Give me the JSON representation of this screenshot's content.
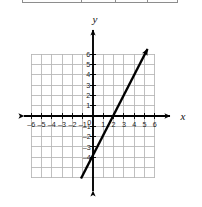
{
  "figure": {
    "background_color": "#ffffff",
    "width": 202,
    "height": 207
  },
  "table_crop": {
    "present": true,
    "border_color": "#8d8d8d",
    "divider_offsets": [
      58,
      92,
      124
    ]
  },
  "axis_labels": {
    "x_name": "x",
    "y_name": "y",
    "origin_label": "0"
  },
  "x_ticks": [
    {
      "value": -6,
      "label": "–6"
    },
    {
      "value": -5,
      "label": "–5"
    },
    {
      "value": -4,
      "label": "–4"
    },
    {
      "value": -3,
      "label": "–3"
    },
    {
      "value": -2,
      "label": "–2"
    },
    {
      "value": -1,
      "label": "–1"
    },
    {
      "value": 1,
      "label": "1"
    },
    {
      "value": 2,
      "label": "2"
    },
    {
      "value": 3,
      "label": "3"
    },
    {
      "value": 4,
      "label": "4"
    },
    {
      "value": 5,
      "label": "5"
    },
    {
      "value": 6,
      "label": "6"
    }
  ],
  "y_ticks": [
    {
      "value": 6,
      "label": "6"
    },
    {
      "value": 5,
      "label": "5"
    },
    {
      "value": 4,
      "label": "4"
    },
    {
      "value": 3,
      "label": "3"
    },
    {
      "value": 2,
      "label": "2"
    },
    {
      "value": 1,
      "label": "1"
    },
    {
      "value": -1,
      "label": "–1"
    },
    {
      "value": -2,
      "label": "–2"
    },
    {
      "value": -3,
      "label": "–3"
    },
    {
      "value": -4,
      "label": "–4"
    }
  ],
  "chart_data": {
    "type": "line",
    "title": "",
    "xlabel": "x",
    "ylabel": "y",
    "xlim": [
      -6.5,
      6.5
    ],
    "ylim": [
      -6.5,
      6.5
    ],
    "grid": true,
    "grid_color": "#b5b5b5",
    "grid_xrange": [
      -6,
      6
    ],
    "grid_yrange": [
      -6,
      6
    ],
    "axis_color": "#000000",
    "legend": "none",
    "series": [
      {
        "name": "line",
        "color": "#000000",
        "equation": "y = 2x - 4",
        "slope": 2,
        "y_intercept": -4,
        "x_intercept": 2,
        "points": [
          {
            "x": -1,
            "y": -6
          },
          {
            "x": 0,
            "y": -4
          },
          {
            "x": 2,
            "y": 0
          },
          {
            "x": 3,
            "y": 2
          },
          {
            "x": 5,
            "y": 6
          }
        ],
        "arrow_start": {
          "x": -1,
          "y": -6
        },
        "arrow_end": {
          "x": 5,
          "y": 6
        }
      }
    ]
  }
}
